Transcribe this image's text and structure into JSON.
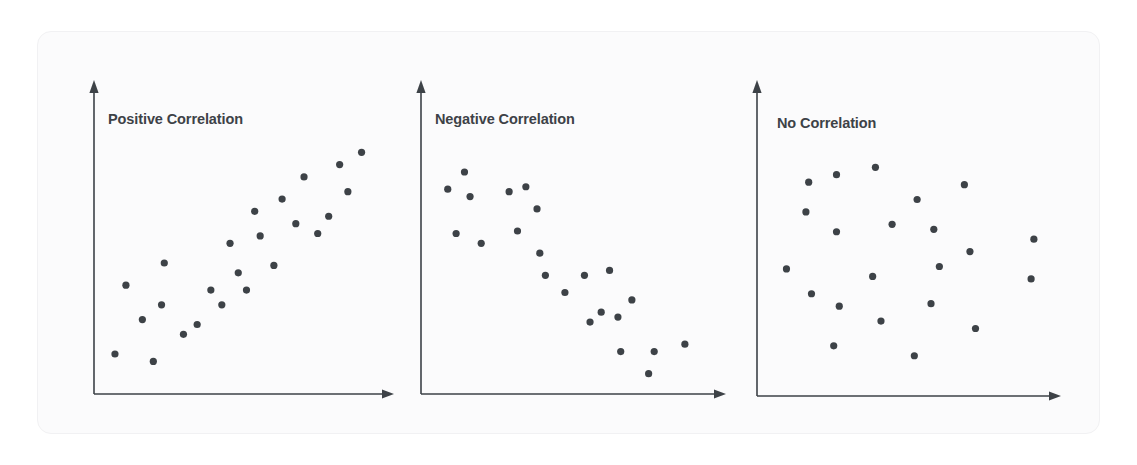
{
  "figure": {
    "kind": "scatter-plot-triptych",
    "background_color": "#ffffff",
    "card_fill": "#fbfbfc",
    "card_border": "#f1f1f3",
    "axis_color": "#3d4247",
    "point_color": "#3d4247",
    "title_color": "#3d4247"
  },
  "panels": [
    {
      "id": "positive-correlation",
      "title": "Positive Correlation",
      "title_x": 108,
      "title_y": 119,
      "axis": {
        "x0": 94,
        "y0": 394,
        "x_end": 392,
        "y_top": 82
      }
    },
    {
      "id": "negative-correlation",
      "title": "Negative Correlation",
      "title_x": 435,
      "title_y": 119,
      "axis": {
        "x0": 421,
        "y0": 394,
        "x_end": 724,
        "y_top": 82
      }
    },
    {
      "id": "no-correlation",
      "title": "No Correlation",
      "title_x": 777,
      "title_y": 123,
      "axis": {
        "x0": 757,
        "y0": 396,
        "x_end": 1059,
        "y_top": 82
      }
    }
  ],
  "chart_data": [
    {
      "type": "scatter",
      "title": "Positive Correlation",
      "xlabel": "",
      "ylabel": "",
      "xlim": [
        0,
        100
      ],
      "ylim": [
        0,
        100
      ],
      "grid": false,
      "legend": "none",
      "n_points": 24,
      "relationship": "positive",
      "points": [
        {
          "x": 4,
          "y": 13
        },
        {
          "x": 8,
          "y": 41
        },
        {
          "x": 14,
          "y": 27
        },
        {
          "x": 18,
          "y": 10
        },
        {
          "x": 21,
          "y": 33
        },
        {
          "x": 22,
          "y": 50
        },
        {
          "x": 29,
          "y": 21
        },
        {
          "x": 34,
          "y": 25
        },
        {
          "x": 39,
          "y": 39
        },
        {
          "x": 43,
          "y": 33
        },
        {
          "x": 46,
          "y": 58
        },
        {
          "x": 49,
          "y": 46
        },
        {
          "x": 52,
          "y": 39
        },
        {
          "x": 55,
          "y": 71
        },
        {
          "x": 57,
          "y": 61
        },
        {
          "x": 62,
          "y": 49
        },
        {
          "x": 65,
          "y": 76
        },
        {
          "x": 70,
          "y": 66
        },
        {
          "x": 73,
          "y": 85
        },
        {
          "x": 78,
          "y": 62
        },
        {
          "x": 82,
          "y": 69
        },
        {
          "x": 86,
          "y": 90
        },
        {
          "x": 89,
          "y": 79
        },
        {
          "x": 94,
          "y": 95
        }
      ]
    },
    {
      "type": "scatter",
      "title": "Negative Correlation",
      "xlabel": "",
      "ylabel": "",
      "xlim": [
        0,
        100
      ],
      "ylim": [
        0,
        100
      ],
      "grid": false,
      "legend": "none",
      "n_points": 22,
      "relationship": "negative",
      "points": [
        {
          "x": 6,
          "y": 80
        },
        {
          "x": 9,
          "y": 62
        },
        {
          "x": 12,
          "y": 87
        },
        {
          "x": 14,
          "y": 77
        },
        {
          "x": 18,
          "y": 58
        },
        {
          "x": 28,
          "y": 79
        },
        {
          "x": 31,
          "y": 63
        },
        {
          "x": 34,
          "y": 81
        },
        {
          "x": 38,
          "y": 72
        },
        {
          "x": 39,
          "y": 54
        },
        {
          "x": 41,
          "y": 45
        },
        {
          "x": 48,
          "y": 38
        },
        {
          "x": 55,
          "y": 45
        },
        {
          "x": 57,
          "y": 26
        },
        {
          "x": 61,
          "y": 30
        },
        {
          "x": 64,
          "y": 47
        },
        {
          "x": 67,
          "y": 28
        },
        {
          "x": 68,
          "y": 14
        },
        {
          "x": 72,
          "y": 35
        },
        {
          "x": 78,
          "y": 5
        },
        {
          "x": 80,
          "y": 14
        },
        {
          "x": 91,
          "y": 17
        }
      ]
    },
    {
      "type": "scatter",
      "title": "No Correlation",
      "xlabel": "",
      "ylabel": "",
      "xlim": [
        0,
        100
      ],
      "ylim": [
        0,
        100
      ],
      "grid": false,
      "legend": "none",
      "n_points": 22,
      "relationship": "none",
      "points": [
        {
          "x": 7,
          "y": 48
        },
        {
          "x": 15,
          "y": 83
        },
        {
          "x": 14,
          "y": 71
        },
        {
          "x": 16,
          "y": 38
        },
        {
          "x": 25,
          "y": 86
        },
        {
          "x": 25,
          "y": 63
        },
        {
          "x": 26,
          "y": 33
        },
        {
          "x": 24,
          "y": 17
        },
        {
          "x": 39,
          "y": 89
        },
        {
          "x": 38,
          "y": 45
        },
        {
          "x": 41,
          "y": 27
        },
        {
          "x": 45,
          "y": 66
        },
        {
          "x": 54,
          "y": 76
        },
        {
          "x": 53,
          "y": 13
        },
        {
          "x": 60,
          "y": 64
        },
        {
          "x": 62,
          "y": 49
        },
        {
          "x": 59,
          "y": 34
        },
        {
          "x": 71,
          "y": 82
        },
        {
          "x": 73,
          "y": 55
        },
        {
          "x": 75,
          "y": 24
        },
        {
          "x": 96,
          "y": 60
        },
        {
          "x": 95,
          "y": 44
        }
      ]
    }
  ]
}
